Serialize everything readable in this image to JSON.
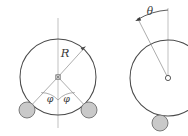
{
  "figure": {
    "background_color": "#ffffff",
    "stroke_color": "#4a4a4a",
    "thin_stroke_color": "#8c8c8c",
    "ball_fill_color": "#c9c9c9",
    "ball_stroke_color": "#6e6e6e",
    "label_color": "#3a3a3a",
    "panels": [
      {
        "id": "left-panel",
        "name": "symmetric-two-ball-circle",
        "circle": {
          "cx": 58,
          "cy": 77,
          "r": 38
        },
        "center_marker": "square",
        "axis": "vertical-centerline",
        "radius_label": "R",
        "angle_labels": [
          "φ",
          "φ"
        ],
        "balls": [
          {
            "name": "left-ball",
            "cx": 27,
            "cy": 110,
            "r": 8
          },
          {
            "name": "right-ball",
            "cx": 89,
            "cy": 110,
            "r": 8
          }
        ]
      },
      {
        "id": "right-panel",
        "name": "tilted-single-ball-circle",
        "circle": {
          "cx": 168,
          "cy": 78,
          "r": 38
        },
        "center_marker": "open-circle",
        "axis": "vertical-centerline",
        "angle_label": "θ",
        "arc_arrow": "counterclockwise",
        "balls": [
          {
            "name": "single-ball",
            "cx": 160,
            "cy": 123,
            "r": 8
          }
        ]
      }
    ]
  },
  "labels": {
    "radius": "R",
    "phi_left": "φ",
    "phi_right": "φ",
    "theta": "θ"
  }
}
